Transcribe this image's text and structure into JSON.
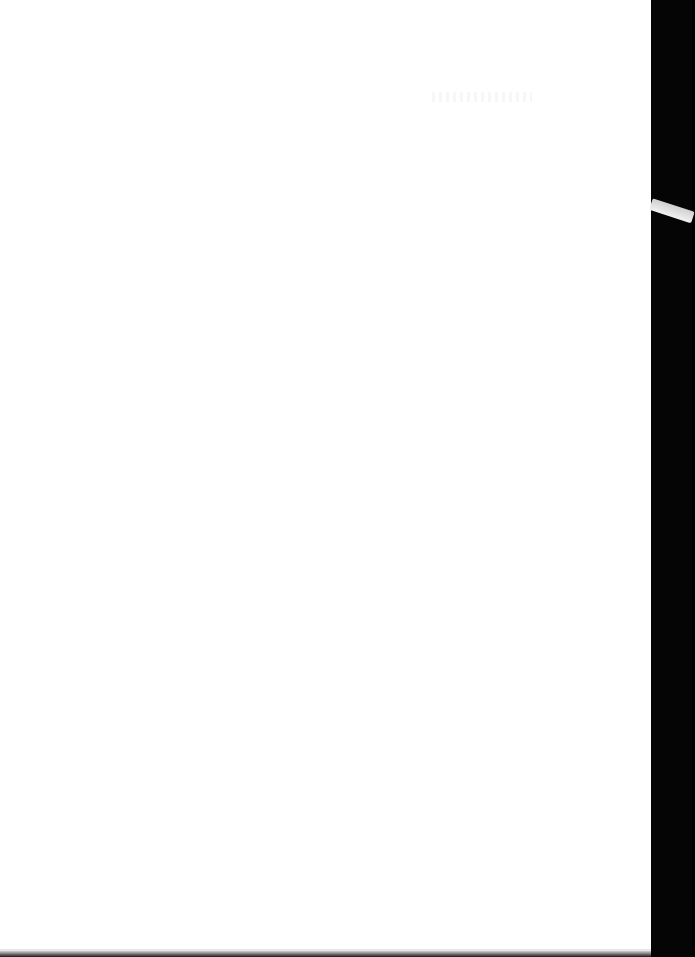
{
  "document": {
    "type": "scanned-page",
    "content": "",
    "page_color": "#ffffff",
    "background_color": "#000000"
  }
}
